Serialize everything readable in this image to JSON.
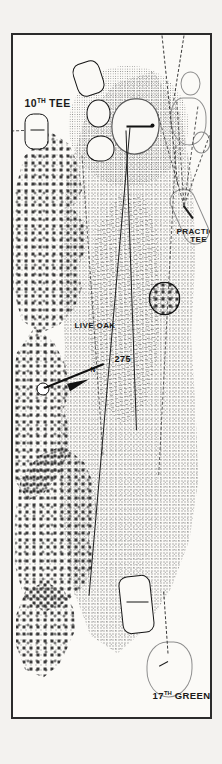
{
  "map": {
    "type": "golf-hole-diagram",
    "orientation": "rotated-90",
    "labels": {
      "ninth_green": "9TH GREEN",
      "ninth_green_ordinal_base": "9",
      "ninth_green_ordinal_sup": "TH",
      "ninth_green_rest": " GREEN",
      "practice_tee_line1": "PRACTICE",
      "practice_tee_line2": "TEE",
      "tenth_tee_base": "10",
      "tenth_tee_sup": "TH",
      "tenth_tee_rest": " TEE",
      "live_oak": "LIVE OAK",
      "seventeenth_green_base": "17",
      "seventeenth_green_sup": "TH",
      "seventeenth_green_rest": " GREEN",
      "yardage_275": "275",
      "north": "N"
    },
    "colors": {
      "ink": "#1a1a1a",
      "paper": "#fbfaf7",
      "page": "#f3f2ef",
      "rough": "#6d6d6d",
      "fairway": "#9a9a9a",
      "trees": "#3a3a3a",
      "green_outline": "#8d8d8d"
    }
  }
}
